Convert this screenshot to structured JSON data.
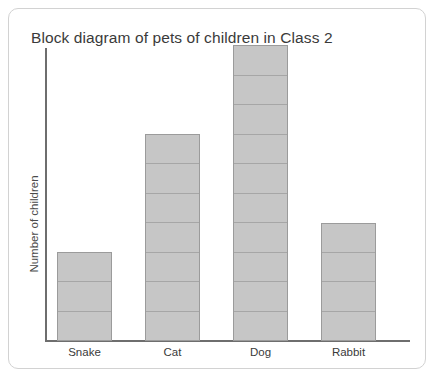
{
  "card": {
    "border_color": "#d2d2d2",
    "background": "#ffffff"
  },
  "title": "Block diagram of pets of children in Class 2",
  "axes": {
    "y_label": "Number of children",
    "axis_color": "#6e6e6e"
  },
  "style": {
    "bar_fill": "#c6c6c6",
    "bar_border": "#9b9b9b",
    "block_divider": "#a6a6a6",
    "text_color": "#3a3a3a"
  },
  "chart_data": {
    "type": "bar",
    "title": "Block diagram of pets of children in Class 2",
    "xlabel": "",
    "ylabel": "Number of children",
    "categories": [
      "Snake",
      "Cat",
      "Dog",
      "Rabbit"
    ],
    "values": [
      3,
      7,
      10,
      4
    ],
    "ylim": [
      0,
      10
    ],
    "grid": false,
    "legend": null,
    "note": "Each bar is subdivided into unit blocks; one block = 1 child."
  }
}
